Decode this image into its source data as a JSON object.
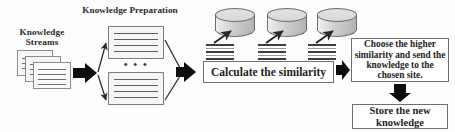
{
  "diagram": {
    "background_color": "#fdfdfd",
    "line_color": "#3d3d3d",
    "box_border_color": "#6f6f6f",
    "labels": {
      "knowledge_streams": "Knowledge\nStreams",
      "knowledge_preparation": "Knowledge Preparation",
      "ellipsis": "• • •"
    },
    "boxes": [
      {
        "id": "calculate-similarity",
        "text": "Calculate the similarity"
      },
      {
        "id": "choose-higher-similarity",
        "text": "Choose the higher similarity and send the knowledge to the chosen site."
      },
      {
        "id": "store-new-knowledge",
        "text": "Store the new knowledge"
      }
    ],
    "nodes": {
      "stream_documents_count": 3,
      "prepared_documents_count": 2,
      "site_databases_count": 3
    },
    "arrows": {
      "streams_to_preparation": "thick-block-arrow-right",
      "preparation_branch": "thin-split-arrows",
      "preparation_merge": "thin-merge-arrows",
      "merge_to_calculate": "thick-block-arrow-right",
      "stripes_to_database": "thin-diagonal-arrow-up-right",
      "calculate_to_choose": "thick-block-arrow-right",
      "choose_to_store": "thick-block-arrow-down"
    }
  }
}
